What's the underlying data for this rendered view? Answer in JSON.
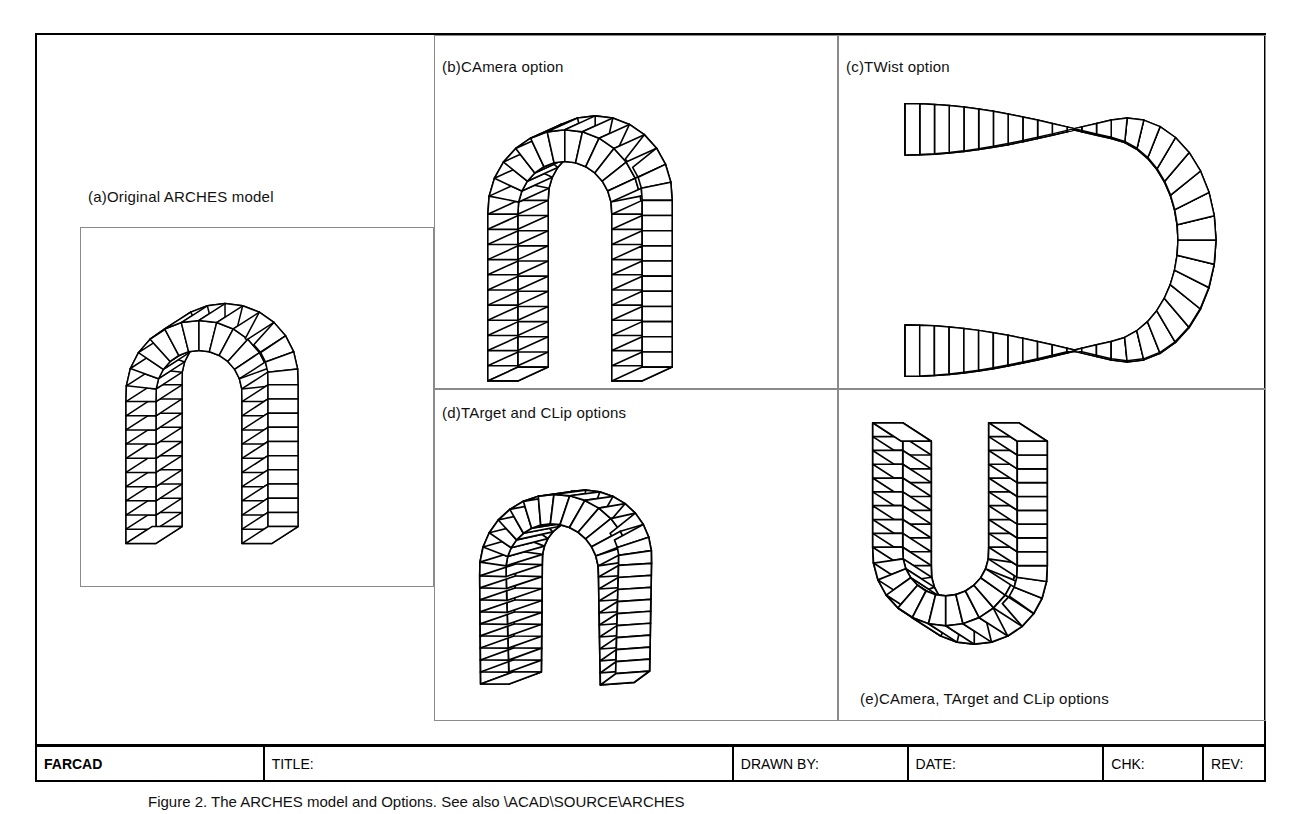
{
  "sheet": {
    "caption": "Figure 2. The ARCHES model and Options.  See also \\ACAD\\SOURCE\\ARCHES"
  },
  "panels": [
    {
      "id": "a",
      "label": "(a)Original ARCHES model",
      "box": {
        "x": 80,
        "y": 227,
        "w": 354,
        "h": 360
      }
    },
    {
      "id": "b",
      "label": "(b)CAmera option",
      "box": {
        "x": 434,
        "y": 35,
        "w": 404,
        "h": 354
      }
    },
    {
      "id": "c",
      "label": "(c)TWist option",
      "box": {
        "x": 838,
        "y": 35,
        "w": 428,
        "h": 354
      }
    },
    {
      "id": "d",
      "label": "(d)TArget and CLip options",
      "box": {
        "x": 434,
        "y": 389,
        "w": 404,
        "h": 332
      }
    },
    {
      "id": "e",
      "label": "(e)CAmera, TArget and CLip options",
      "box": {
        "x": 838,
        "y": 389,
        "w": 428,
        "h": 332
      }
    }
  ],
  "title_block": {
    "logo": "FARCAD",
    "fields": [
      {
        "name": "title",
        "label": "TITLE:",
        "value": "",
        "width": 470
      },
      {
        "name": "drawn_by",
        "label": "DRAWN BY:",
        "value": "",
        "width": 175
      },
      {
        "name": "date",
        "label": "DATE:",
        "value": "",
        "width": 196
      },
      {
        "name": "chk",
        "label": "CHK:",
        "value": "",
        "width": 100
      },
      {
        "name": "rev",
        "label": "REV:",
        "value": "",
        "width": 60
      }
    ],
    "logo_width": 228
  },
  "colors": {
    "ink": "#000000",
    "panel_rule": "#8a8a8a",
    "paper": "#ffffff"
  },
  "geometry": {
    "stroke": "#000000",
    "fill": "#ffffff",
    "note": "segmented extruded arch wireframes"
  }
}
